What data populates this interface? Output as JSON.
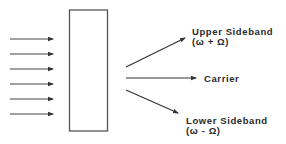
{
  "diagram": {
    "type": "modulation-sideband-diagram",
    "input_arrows": {
      "count": 6,
      "y_positions": [
        39,
        54,
        69,
        84,
        99,
        114
      ],
      "x_start": 10,
      "x_end": 53
    },
    "modulator_box": {
      "x": 69,
      "y": 10,
      "width": 38,
      "height": 121
    },
    "outputs": [
      {
        "id": "upper",
        "label": "Upper Sideband",
        "formula": "(ω + Ω)"
      },
      {
        "id": "carrier",
        "label": "Carrier"
      },
      {
        "id": "lower",
        "label": "Lower Sideband",
        "formula": "(ω - Ω)"
      }
    ],
    "colors": {
      "stroke": "#444444",
      "text": "#2a2a2a",
      "background": "#ffffff"
    }
  }
}
